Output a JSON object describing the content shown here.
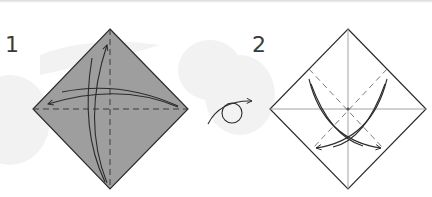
{
  "steps": [
    {
      "number": "1",
      "paper_color": "#9e9e9e",
      "side": "colored"
    },
    {
      "number": "2",
      "paper_color": "#ffffff",
      "side": "white"
    }
  ],
  "icons": {
    "turn_over": "turn-over-icon"
  },
  "colors": {
    "line": "#2b2b2b",
    "dashed": "#555555",
    "crease": "#9a9a9a",
    "watermark": "#f1f1f1"
  }
}
